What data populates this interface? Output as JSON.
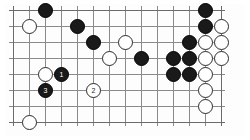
{
  "diagram": {
    "type": "go-board-problem-diagram",
    "board": {
      "columns": 14,
      "rows": 8,
      "line_color": "#8a8a8a",
      "edge_color": "#6b6b6b",
      "background_color": "#fdfdfd",
      "cell_size": 16,
      "origin_x": 8,
      "origin_y": 6
    },
    "colors": {
      "black_stone": "#1a1a1a",
      "white_stone": "#ffffff",
      "black_outline": "#000000",
      "white_outline": "#2b2b2b",
      "black_label_text": "#ffffff",
      "white_label_text": "#1a1a1a"
    },
    "stones": [
      {
        "id": "b-c2-r0",
        "color": "black",
        "col": 2,
        "row": 0,
        "label": ""
      },
      {
        "id": "b-c12-r0",
        "color": "black",
        "col": 12,
        "row": 0,
        "label": ""
      },
      {
        "id": "w-c1-r1",
        "color": "white",
        "col": 1,
        "row": 1,
        "label": ""
      },
      {
        "id": "b-c4-r1",
        "color": "black",
        "col": 4,
        "row": 1,
        "label": ""
      },
      {
        "id": "b-c12-r1",
        "color": "black",
        "col": 12,
        "row": 1,
        "label": ""
      },
      {
        "id": "w-c13-r1",
        "color": "white",
        "col": 13,
        "row": 1,
        "label": ""
      },
      {
        "id": "b-c5-r2",
        "color": "black",
        "col": 5,
        "row": 2,
        "label": ""
      },
      {
        "id": "w-c7-r2",
        "color": "white",
        "col": 7,
        "row": 2,
        "label": ""
      },
      {
        "id": "b-c11-r2",
        "color": "black",
        "col": 11,
        "row": 2,
        "label": ""
      },
      {
        "id": "w-c12-r2",
        "color": "white",
        "col": 12,
        "row": 2,
        "label": ""
      },
      {
        "id": "w-c13-r2",
        "color": "white",
        "col": 13,
        "row": 2,
        "label": ""
      },
      {
        "id": "w-c6-r3",
        "color": "white",
        "col": 6,
        "row": 3,
        "label": ""
      },
      {
        "id": "b-c8-r3",
        "color": "black",
        "col": 8,
        "row": 3,
        "label": ""
      },
      {
        "id": "b-c10-r3",
        "color": "black",
        "col": 10,
        "row": 3,
        "label": ""
      },
      {
        "id": "b-c11-r3",
        "color": "black",
        "col": 11,
        "row": 3,
        "label": ""
      },
      {
        "id": "w-c12-r3",
        "color": "white",
        "col": 12,
        "row": 3,
        "label": ""
      },
      {
        "id": "w-c13-r3",
        "color": "white",
        "col": 13,
        "row": 3,
        "label": ""
      },
      {
        "id": "w-c2-r4",
        "color": "white",
        "col": 2,
        "row": 4,
        "label": ""
      },
      {
        "id": "b-c3-r4",
        "color": "black",
        "col": 3,
        "row": 4,
        "label": "1"
      },
      {
        "id": "b-c10-r4",
        "color": "black",
        "col": 10,
        "row": 4,
        "label": ""
      },
      {
        "id": "b-c11-r4",
        "color": "black",
        "col": 11,
        "row": 4,
        "label": ""
      },
      {
        "id": "w-c12-r4",
        "color": "white",
        "col": 12,
        "row": 4,
        "label": ""
      },
      {
        "id": "b-c2-r5",
        "color": "black",
        "col": 2,
        "row": 5,
        "label": "3"
      },
      {
        "id": "w-c5-r5",
        "color": "white",
        "col": 5,
        "row": 5,
        "label": "2"
      },
      {
        "id": "w-c12-r5",
        "color": "white",
        "col": 12,
        "row": 5,
        "label": ""
      },
      {
        "id": "w-c12-r6",
        "color": "white",
        "col": 12,
        "row": 6,
        "label": ""
      },
      {
        "id": "w-c1-r7",
        "color": "white",
        "col": 1,
        "row": 7,
        "label": ""
      }
    ]
  }
}
